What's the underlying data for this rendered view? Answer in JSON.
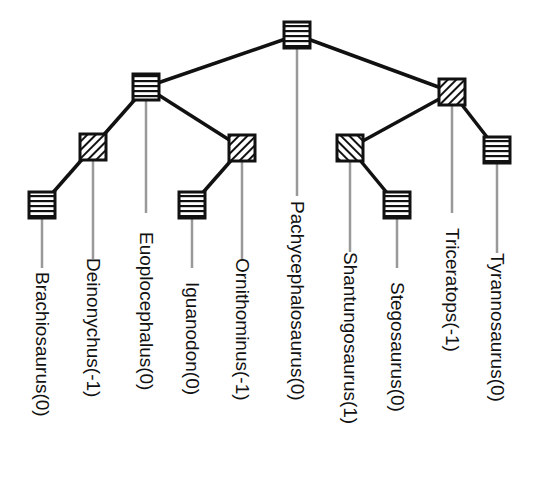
{
  "diagram": {
    "type": "phylogenetic-tree",
    "colors": {
      "edge": "#111111",
      "leader": "#999999",
      "node_border": "#111111",
      "node_fill": "#ffffff",
      "text": "#111111"
    },
    "legend_patterns": {
      "0": "horizontal-stripes",
      "-1": "forward-diagonal-hatch",
      "1": "back-diagonal-hatch"
    },
    "nodes": [
      {
        "id": "root",
        "x": 297,
        "y": 35,
        "value": 0
      },
      {
        "id": "n_left",
        "x": 146,
        "y": 87,
        "value": 0
      },
      {
        "id": "n_right",
        "x": 452,
        "y": 92,
        "value": -1
      },
      {
        "id": "n_deino",
        "x": 93,
        "y": 147,
        "value": -1
      },
      {
        "id": "n_ornitho",
        "x": 242,
        "y": 148,
        "value": -1
      },
      {
        "id": "n_brachio",
        "x": 42,
        "y": 205,
        "value": 0
      },
      {
        "id": "n_iguano",
        "x": 192,
        "y": 205,
        "value": 0
      },
      {
        "id": "n_shantung",
        "x": 350,
        "y": 148,
        "value": 1
      },
      {
        "id": "n_tyranno",
        "x": 497,
        "y": 150,
        "value": 0
      },
      {
        "id": "n_stego",
        "x": 397,
        "y": 205,
        "value": 0
      }
    ],
    "edges": [
      [
        "root",
        "n_left"
      ],
      [
        "root",
        "n_right"
      ],
      [
        "n_left",
        "n_deino"
      ],
      [
        "n_left",
        "n_ornitho"
      ],
      [
        "n_deino",
        "n_brachio"
      ],
      [
        "n_ornitho",
        "n_iguano"
      ],
      [
        "n_right",
        "n_shantung"
      ],
      [
        "n_right",
        "n_tyranno"
      ],
      [
        "n_shantung",
        "n_stego"
      ]
    ],
    "leaves": [
      {
        "name": "Brachiosaurus(0)",
        "from": "n_brachio",
        "x": 42,
        "line_end": 268,
        "label_top": 272
      },
      {
        "name": "Deinonychus(-1)",
        "from": "n_deino",
        "x": 93,
        "line_end": 259,
        "label_top": 258
      },
      {
        "name": "Euoplocephalus(0)",
        "from": "n_left",
        "x": 146,
        "line_end": 213,
        "label_top": 232
      },
      {
        "name": "Iguanodon(0)",
        "from": "n_iguano",
        "x": 192,
        "line_end": 268,
        "label_top": 282
      },
      {
        "name": "Ornithominus(-1)",
        "from": "n_ornitho",
        "x": 242,
        "line_end": 259,
        "label_top": 258
      },
      {
        "name": "Pachycephalosaurus(0)",
        "from": "root",
        "x": 297,
        "line_end": 196,
        "label_top": 201
      },
      {
        "name": "Shantungosaurus(1)",
        "from": "n_shantung",
        "x": 350,
        "line_end": 252,
        "label_top": 252
      },
      {
        "name": "Stegosaurus(0)",
        "from": "n_stego",
        "x": 397,
        "line_end": 268,
        "label_top": 282
      },
      {
        "name": "Triceratops(-1)",
        "from": "n_right",
        "x": 452,
        "line_end": 213,
        "label_top": 228
      },
      {
        "name": "Tyrannosaurus(0)",
        "from": "n_tyranno",
        "x": 497,
        "line_end": 253,
        "label_top": 253
      }
    ]
  }
}
